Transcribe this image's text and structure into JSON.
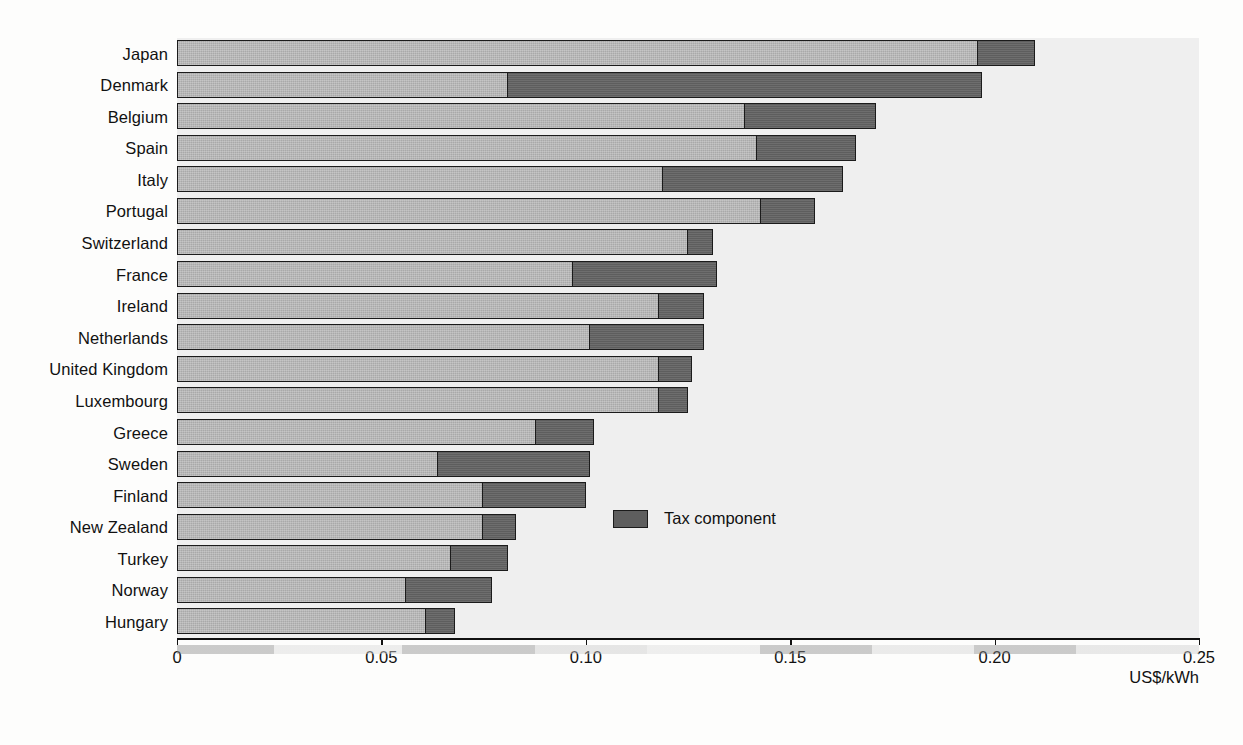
{
  "chart_data": {
    "type": "bar",
    "orientation": "horizontal",
    "stacked": true,
    "title": "",
    "xlabel": "US$/kWh",
    "ylabel": "",
    "xlim": [
      0,
      0.25
    ],
    "xticks": [
      0,
      0.05,
      0.1,
      0.15,
      0.2,
      0.25
    ],
    "xtick_labels": [
      "0",
      "0.05",
      "0.10",
      "0.15",
      "0.20",
      "0.25"
    ],
    "grid": false,
    "legend": {
      "position": "inside-right",
      "entries": [
        {
          "label": "Tax component",
          "color": "#5e5e5e"
        }
      ]
    },
    "series": [
      {
        "name": "Pre-tax price",
        "color": "#a9a9a9",
        "values": [
          0.196,
          0.081,
          0.139,
          0.142,
          0.119,
          0.143,
          0.125,
          0.097,
          0.118,
          0.101,
          0.118,
          0.118,
          0.088,
          0.064,
          0.075,
          0.075,
          0.067,
          0.056,
          0.061
        ]
      },
      {
        "name": "Tax component",
        "color": "#5e5e5e",
        "values": [
          0.014,
          0.116,
          0.032,
          0.024,
          0.044,
          0.013,
          0.006,
          0.035,
          0.011,
          0.028,
          0.008,
          0.007,
          0.014,
          0.037,
          0.025,
          0.008,
          0.014,
          0.021,
          0.007
        ]
      }
    ],
    "categories": [
      "Japan",
      "Denmark",
      "Belgium",
      "Spain",
      "Italy",
      "Portugal",
      "Switzerland",
      "France",
      "Ireland",
      "Netherlands",
      "United Kingdom",
      "Luxembourg",
      "Greece",
      "Sweden",
      "Finland",
      "New Zealand",
      "Turkey",
      "Norway",
      "Hungary"
    ],
    "totals": [
      0.21,
      0.197,
      0.171,
      0.166,
      0.163,
      0.156,
      0.131,
      0.132,
      0.129,
      0.129,
      0.126,
      0.125,
      0.102,
      0.101,
      0.1,
      0.083,
      0.081,
      0.077,
      0.068
    ]
  },
  "legend": {
    "tax_label": "Tax component"
  },
  "axis": {
    "unit": "US$/kWh"
  },
  "artifacts": {
    "top_title_ghost": "",
    "side_text_ghost": ""
  }
}
